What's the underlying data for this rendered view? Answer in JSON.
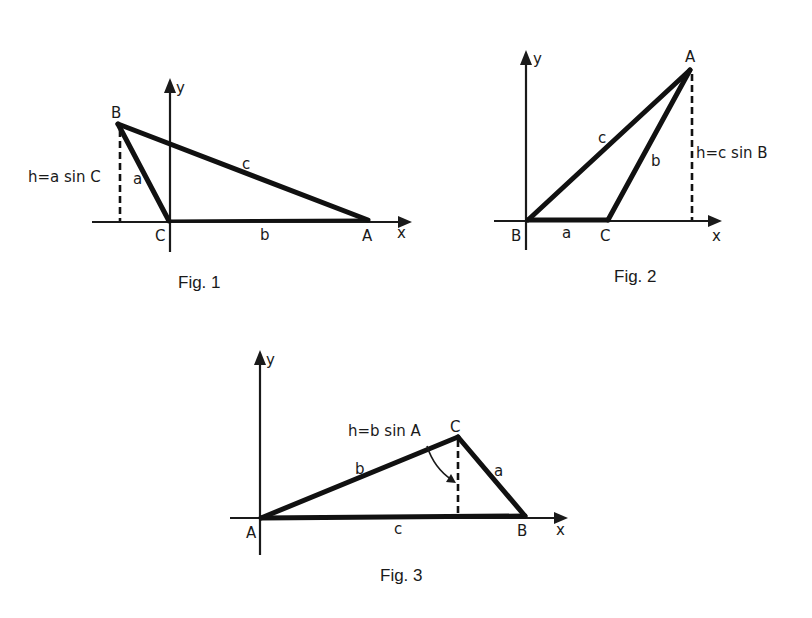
{
  "figures": [
    {
      "caption": "Fig. 1",
      "axes": {
        "x_label": "x",
        "y_label": "y"
      },
      "vertices": {
        "A": "A",
        "B": "B",
        "C": "C"
      },
      "sides": {
        "a": "a",
        "b": "b",
        "c": "c"
      },
      "height_label": "h=a sin C"
    },
    {
      "caption": "Fig. 2",
      "axes": {
        "x_label": "x",
        "y_label": "y"
      },
      "vertices": {
        "A": "A",
        "B": "B",
        "C": "C"
      },
      "sides": {
        "a": "a",
        "b": "b",
        "c": "c"
      },
      "height_label": "h=c sin B"
    },
    {
      "caption": "Fig. 3",
      "axes": {
        "x_label": "x",
        "y_label": "y"
      },
      "vertices": {
        "A": "A",
        "B": "B",
        "C": "C"
      },
      "sides": {
        "a": "a",
        "b": "b",
        "c": "c"
      },
      "height_label": "h=b sin A"
    }
  ]
}
